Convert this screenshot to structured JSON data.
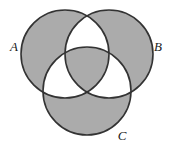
{
  "figure": {
    "kind": "venn-diagram",
    "set_count": 3,
    "canvas": {
      "width": 177,
      "height": 146
    },
    "colors": {
      "background": "#ffffff",
      "shaded_fill": "#ababab",
      "unshaded_fill": "#ffffff",
      "outline": "#333333"
    },
    "outline_width": 1.6
  },
  "sets": [
    {
      "id": "A",
      "label": "A",
      "label_x": 14,
      "label_y": 51,
      "cx": 65,
      "cy": 54,
      "r": 44
    },
    {
      "id": "B",
      "label": "B",
      "label_x": 158,
      "label_y": 51,
      "cx": 109,
      "cy": 54,
      "r": 44
    },
    {
      "id": "C",
      "label": "C",
      "label_x": 122,
      "label_y": 140,
      "cx": 87,
      "cy": 91,
      "r": 44
    }
  ],
  "regions": [
    {
      "id": "A-only",
      "description": "A only",
      "shaded": true
    },
    {
      "id": "B-only",
      "description": "B only",
      "shaded": true
    },
    {
      "id": "C-only",
      "description": "C only",
      "shaded": true
    },
    {
      "id": "AB-only",
      "description": "A and B, not C",
      "shaded": false
    },
    {
      "id": "AC-only",
      "description": "A and C, not B",
      "shaded": false
    },
    {
      "id": "BC-only",
      "description": "B and C, not A",
      "shaded": false
    },
    {
      "id": "ABC",
      "description": "A and B and C",
      "shaded": true
    }
  ]
}
